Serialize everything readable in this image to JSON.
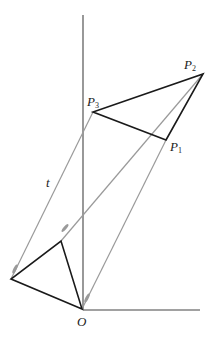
{
  "diagram": {
    "title": "",
    "colors": {
      "axes": "#444444",
      "triangle": "#1a1a1a",
      "translation": "#9a9a9a"
    },
    "labels": {
      "origin": "O",
      "t": "t",
      "p1": "P",
      "p1_sub": "1",
      "p2": "P",
      "p2_sub": "2",
      "p3": "P",
      "p3_sub": "3"
    },
    "points": {
      "O": [
        82,
        309
      ],
      "A": [
        11,
        279
      ],
      "B": [
        61,
        241
      ],
      "P1": [
        166,
        140
      ],
      "P2": [
        203,
        74
      ],
      "P3": [
        93,
        112
      ]
    },
    "axes": {
      "vertical": {
        "from": [
          83,
          15
        ],
        "to": [
          83,
          310
        ]
      },
      "horizontal": {
        "from": [
          83,
          310
        ],
        "to": [
          200,
          310
        ]
      }
    }
  }
}
